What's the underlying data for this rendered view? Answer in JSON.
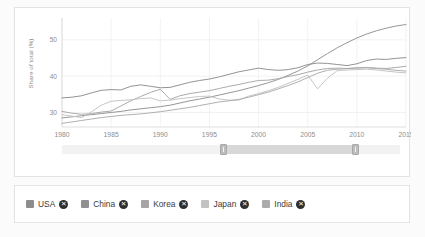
{
  "chart_card": {
    "yaxis_title": "Share of total (%)"
  },
  "range_slider": {
    "name": "year-range-slider",
    "left_handle": "▏",
    "right_handle": "▏"
  },
  "legend": {
    "items": [
      {
        "label": "USA",
        "color": "#8d8d8d",
        "close": "✕"
      },
      {
        "label": "China",
        "color": "#909090",
        "close": "✕"
      },
      {
        "label": "Korea",
        "color": "#a5a5a5",
        "close": "✕"
      },
      {
        "label": "Japan",
        "color": "#c2c2c2",
        "close": "✕"
      },
      {
        "label": "India",
        "color": "#ababab",
        "close": "✕"
      }
    ]
  },
  "chart_data": {
    "type": "line",
    "title": "",
    "xlabel": "",
    "ylabel": "Share of total (%)",
    "xlim": [
      1980,
      2015
    ],
    "ylim": [
      26,
      56
    ],
    "xticks": [
      1980,
      1985,
      1990,
      1995,
      2000,
      2005,
      2010,
      2015
    ],
    "yticks": [
      30,
      40,
      50
    ],
    "grid": true,
    "legend_position": "below-chart",
    "x": [
      1980,
      1981,
      1982,
      1983,
      1984,
      1985,
      1986,
      1987,
      1988,
      1989,
      1990,
      1991,
      1992,
      1993,
      1994,
      1995,
      1996,
      1997,
      1998,
      1999,
      2000,
      2001,
      2002,
      2003,
      2004,
      2005,
      2006,
      2007,
      2008,
      2009,
      2010,
      2011,
      2012,
      2013,
      2014,
      2015
    ],
    "series": [
      {
        "name": "USA",
        "color": "#8d8d8d",
        "values": [
          34.0,
          34.2,
          34.6,
          35.4,
          36.1,
          36.3,
          36.2,
          37.2,
          37.6,
          37.2,
          36.8,
          36.9,
          37.6,
          38.3,
          38.8,
          39.2,
          39.8,
          40.5,
          41.2,
          41.7,
          42.2,
          41.8,
          41.6,
          41.8,
          42.3,
          43.2,
          43.6,
          43.5,
          43.2,
          42.9,
          43.4,
          44.3,
          44.7,
          44.6,
          44.9,
          45.1
        ]
      },
      {
        "name": "China",
        "color": "#909090",
        "values": [
          28.5,
          28.8,
          29.1,
          29.4,
          29.7,
          30.0,
          30.3,
          30.7,
          31.0,
          31.3,
          31.6,
          32.0,
          32.6,
          33.2,
          33.7,
          34.2,
          34.8,
          35.4,
          36.0,
          36.7,
          37.4,
          38.2,
          39.1,
          40.2,
          41.4,
          42.8,
          44.5,
          46.2,
          47.8,
          49.2,
          50.5,
          51.6,
          52.5,
          53.2,
          53.8,
          54.2
        ]
      },
      {
        "name": "Korea",
        "color": "#a5a5a5",
        "values": [
          30.3,
          29.8,
          29.5,
          29.7,
          30.1,
          30.4,
          31.8,
          33.2,
          34.4,
          35.5,
          36.4,
          33.6,
          34.6,
          35.2,
          35.6,
          36.0,
          36.6,
          37.2,
          37.7,
          38.3,
          38.8,
          38.9,
          39.3,
          39.9,
          40.4,
          41.1,
          41.7,
          42.1,
          42.2,
          42.1,
          42.3,
          42.4,
          42.2,
          42.1,
          42.4,
          42.7
        ]
      },
      {
        "name": "Japan",
        "color": "#c2c2c2",
        "values": [
          29.4,
          29.0,
          28.6,
          30.2,
          32.0,
          33.1,
          33.3,
          33.5,
          33.8,
          34.0,
          33.2,
          33.4,
          33.8,
          34.1,
          34.4,
          34.5,
          33.7,
          33.4,
          33.4,
          34.5,
          35.2,
          36.0,
          36.9,
          38.0,
          39.1,
          40.3,
          36.5,
          39.4,
          41.5,
          41.7,
          41.8,
          41.9,
          41.7,
          41.4,
          41.1,
          40.9
        ]
      },
      {
        "name": "India",
        "color": "#ababab",
        "values": [
          27.0,
          27.4,
          27.8,
          28.2,
          28.6,
          28.9,
          29.2,
          29.4,
          29.6,
          29.9,
          30.2,
          30.6,
          31.0,
          31.4,
          31.9,
          32.4,
          32.9,
          33.2,
          33.6,
          34.2,
          34.9,
          35.6,
          36.5,
          37.4,
          38.4,
          39.6,
          40.8,
          41.6,
          41.9,
          42.1,
          42.2,
          42.3,
          42.1,
          41.9,
          41.6,
          41.4
        ]
      }
    ]
  }
}
